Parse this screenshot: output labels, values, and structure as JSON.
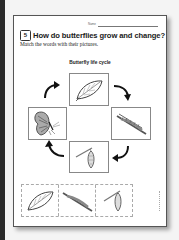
{
  "worksheet": {
    "name_label": "Name",
    "lesson_number": "5",
    "title": "How do butterflies grow and change?",
    "instructions": "Match the words with their pictures.",
    "diagram": {
      "title": "Butterfly life cycle",
      "stages": [
        {
          "id": "egg",
          "icon": "leaf-with-eggs-icon",
          "position": "top"
        },
        {
          "id": "caterpillar",
          "icon": "caterpillar-on-branch-icon",
          "position": "right"
        },
        {
          "id": "chrysalis",
          "icon": "chrysalis-icon",
          "position": "bottom"
        },
        {
          "id": "butterfly",
          "icon": "butterfly-icon",
          "position": "left"
        }
      ],
      "arrows": [
        "clockwise-arrow-top-right",
        "clockwise-arrow-bottom-right",
        "clockwise-arrow-bottom-left",
        "clockwise-arrow-top-left"
      ]
    },
    "cutout_strip": [
      {
        "icon": "leaf-with-eggs-icon"
      },
      {
        "icon": "caterpillar-on-branch-icon"
      },
      {
        "icon": "chrysalis-icon"
      }
    ]
  },
  "colors": {
    "page": "#ffffff",
    "background": "#f4f4f4",
    "ink": "#1a1a1a",
    "box_border": "#888888"
  }
}
